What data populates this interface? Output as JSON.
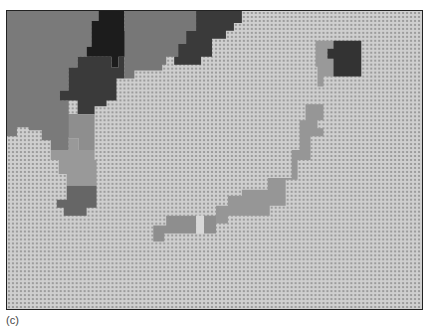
{
  "figure": {
    "caption": "(c)",
    "background_color": "#c8c8c8",
    "pattern_dot_color": "#9a9a9a",
    "frame_color": "#222222"
  },
  "map": {
    "width": 417,
    "height": 300,
    "origin": [
      6,
      10
    ],
    "regions": [
      {
        "name": "west-landmass",
        "fill": "#7a7a7a",
        "points": "0,0 92,0 92,10 85,10 85,36 80,36 80,46 71,46 71,57 62,57 62,80 53,80 53,90 62,90 62,104 71,104 71,127 62,127 62,140 44,140 44,130 35,130 35,120 22,120 22,117 10,117 10,126 0,126"
      },
      {
        "name": "north-dark-peak",
        "fill": "#1c1c1c",
        "points": "92,0 118,0 118,20 126,20 126,46 112,46 112,57 105,57 105,46 80,46 80,36 85,36 85,10 92,10"
      },
      {
        "name": "north-dark-slope",
        "fill": "#3a3a3a",
        "points": "80,46 105,46 105,57 112,57 112,46 118,46 118,68 110,68 110,90 100,90 100,96 88,96 88,104 71,104 71,90 53,90 53,80 62,80 62,57 71,57 71,46"
      },
      {
        "name": "north-central-gray",
        "fill": "#777777",
        "points": "118,0 190,0 190,20 180,20 180,33 172,33 172,46 160,46 160,54 156,54 156,60 128,60 128,68 118,68"
      },
      {
        "name": "northeast-dark",
        "fill": "#3a3a3a",
        "points": "190,0 236,0 236,12 228,12 228,20 220,20 220,28 206,28 206,46 195,46 195,54 168,54 168,46 172,46 172,33 180,33 180,20 190,20"
      },
      {
        "name": "peninsula-mid",
        "fill": "#8e8e8e",
        "points": "62,104 88,104 88,140 72,140 72,128 62,128"
      },
      {
        "name": "peninsula-lower",
        "fill": "#999999",
        "points": "44,140 62,140 62,128 72,128 72,140 88,140 88,150 90,150 90,176 60,176 60,164 52,164 52,150 44,150"
      },
      {
        "name": "peninsula-tip",
        "fill": "#666666",
        "points": "60,176 90,176 90,198 80,198 80,206 57,206 57,198 50,198 50,190 60,190"
      },
      {
        "name": "island-north-gray",
        "fill": "#999999",
        "points": "310,30 328,30 328,38 322,38 322,48 328,48 328,66 318,66 318,76 312,76 312,56 310,56"
      },
      {
        "name": "island-north-dark",
        "fill": "#333333",
        "points": "328,30 356,30 356,66 328,66 328,48 322,48 322,38 328,38"
      },
      {
        "name": "main-island",
        "fill": "#969696",
        "points": "305,94 318,94 318,110 312,110 312,118 318,118 318,126 305,126 305,150 292,150 292,170 280,170 280,196 264,196 264,206 222,206 222,214 210,214 210,196 222,196 222,186 236,186 236,180 262,180 262,168 286,168 286,140 294,140 294,110 300,110 300,94"
      },
      {
        "name": "southwest-island",
        "fill": "#8e8e8e",
        "points": "160,206 190,206 190,224 158,224 158,232 147,232 147,216 160,216"
      },
      {
        "name": "southwest-island-light",
        "fill": "#d8d8d8",
        "points": "190,206 198,206 198,224 190,224"
      },
      {
        "name": "southwest-island-east",
        "fill": "#8e8e8e",
        "points": "198,206 210,206 210,224 198,224"
      }
    ]
  }
}
